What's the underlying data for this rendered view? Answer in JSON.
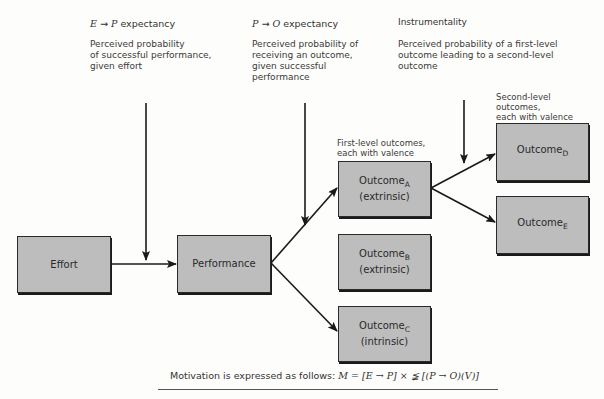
{
  "headers": {
    "ep": {
      "from": "E",
      "arrow": "→",
      "to": "P",
      "suffix": " expectancy",
      "desc": [
        "Perceived probability",
        "of successful performance,",
        "given effort"
      ]
    },
    "po": {
      "from": "P",
      "arrow": "→",
      "to": "O",
      "suffix": " expectancy",
      "desc": [
        "Perceived probability of",
        "receiving an outcome,",
        "given successful",
        "performance"
      ]
    },
    "inst": {
      "title": "Instrumentality",
      "desc": [
        "Perceived probability of a first-level",
        "outcome leading to a second-level",
        "outcome"
      ]
    }
  },
  "annotations": {
    "first_level": [
      "First-level outcomes,",
      "each with valence"
    ],
    "second_level": [
      "Second-level",
      "outcomes,",
      "each with valence"
    ]
  },
  "boxes": {
    "effort": {
      "label": "Effort"
    },
    "performance": {
      "label": "Performance"
    },
    "outcome_a": {
      "label": "Outcome",
      "sub": "A",
      "type": "(extrinsic)"
    },
    "outcome_b": {
      "label": "Outcome",
      "sub": "B",
      "type": "(extrinsic)"
    },
    "outcome_c": {
      "label": "Outcome",
      "sub": "C",
      "type": "(intrinsic)"
    },
    "outcome_d": {
      "label": "Outcome",
      "sub": "D"
    },
    "outcome_e": {
      "label": "Outcome",
      "sub": "E"
    }
  },
  "formula": {
    "prefix": "Motivation is expressed as follows: ",
    "expr": "M = [E → P] × ≨ [(P → O)(V)]"
  },
  "colors": {
    "box_fill": "#bdbdbd",
    "line": "#1a1a1a",
    "background": "#fdfdfb"
  }
}
